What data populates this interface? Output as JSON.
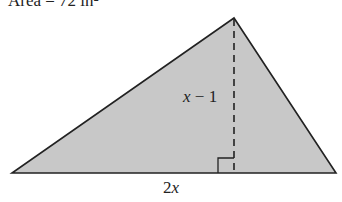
{
  "title": "Area = 72 in²",
  "diagram": {
    "shape": "triangle",
    "fill": "#c8c8c8",
    "stroke": "#222222",
    "vertices": {
      "apex": [
        234,
        18
      ],
      "left": [
        12,
        173
      ],
      "right": [
        336,
        173
      ]
    },
    "height_label_var": "x",
    "height_label_rest": " − 1",
    "base_label_coef": "2",
    "base_label_var": "x",
    "altitude_style": "dashed",
    "right_angle_marker": true
  }
}
